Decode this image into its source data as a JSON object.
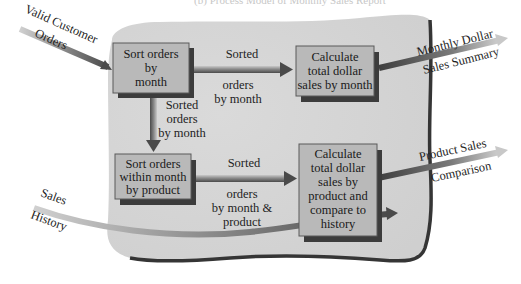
{
  "title": "(b) Process Model of Monthly Sales Report",
  "colors": {
    "blob_fill": "#d6d6d6",
    "blob_edge": "#3a3a3a",
    "box_fill": "#b9b9b9",
    "box_border": "#5a5a5a",
    "box_shadow": "#3c3c3c",
    "arrow_dark": "#555555",
    "arrow_light": "#bdbdbd"
  },
  "processes": [
    {
      "id": "p1",
      "lines": [
        "Sort orders",
        "by",
        "month"
      ]
    },
    {
      "id": "p2",
      "lines": [
        "Calculate",
        "total dollar",
        "sales by month"
      ]
    },
    {
      "id": "p3",
      "lines": [
        "Sort orders",
        "within month",
        "by product"
      ]
    },
    {
      "id": "p4",
      "lines": [
        "Calculate",
        "total dollar",
        "sales by",
        "product and",
        "compare to",
        "history"
      ]
    }
  ],
  "flows": {
    "input_orders": {
      "line1": "Valid Customer",
      "line2": "Orders"
    },
    "input_history": {
      "line1": "Sales",
      "line2": "History"
    },
    "p1_to_p2": {
      "above": "Sorted",
      "below1": "orders",
      "below2": "by month"
    },
    "p1_to_p3": {
      "line1": "Sorted",
      "line2": "orders",
      "line3": "by month"
    },
    "p3_to_p4": {
      "above": "Sorted",
      "below1": "orders",
      "below2": "by month &",
      "below3": "product"
    },
    "output_monthly": {
      "line1": "Monthly Dollar",
      "line2": "Sales Summary"
    },
    "output_product": {
      "line1": "Product Sales",
      "line2": "Comparison"
    }
  }
}
